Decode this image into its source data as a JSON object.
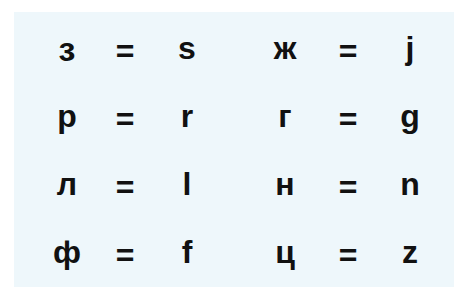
{
  "panel": {
    "background": "#eef7fb"
  },
  "rows": [
    {
      "left": {
        "cyr": "з",
        "eq": "=",
        "lat": "s"
      },
      "right": {
        "cyr": "ж",
        "eq": "=",
        "lat": "j"
      }
    },
    {
      "left": {
        "cyr": "р",
        "eq": "=",
        "lat": "r"
      },
      "right": {
        "cyr": "г",
        "eq": "=",
        "lat": "g"
      }
    },
    {
      "left": {
        "cyr": "л",
        "eq": "=",
        "lat": "l"
      },
      "right": {
        "cyr": "н",
        "eq": "=",
        "lat": "n"
      }
    },
    {
      "left": {
        "cyr": "ф",
        "eq": "=",
        "lat": "f"
      },
      "right": {
        "cyr": "ц",
        "eq": "=",
        "lat": "z"
      }
    }
  ]
}
